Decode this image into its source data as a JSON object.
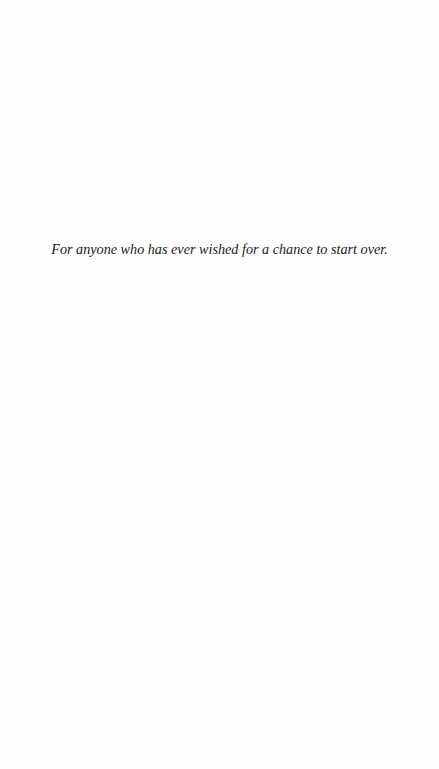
{
  "page": {
    "type": "dedication",
    "background_color": "#fefefe",
    "text_color": "#1a1a1a"
  },
  "dedication": {
    "text": "For anyone who has ever wished for a chance to start over."
  }
}
